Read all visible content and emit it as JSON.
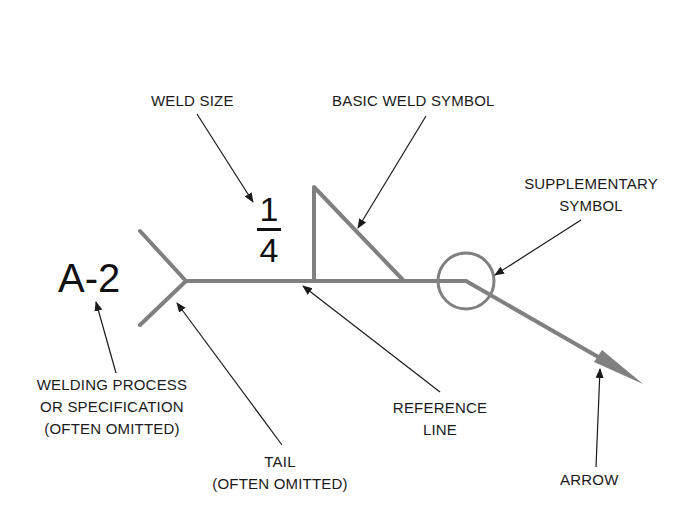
{
  "diagram": {
    "type": "welding-symbol-anatomy",
    "colors": {
      "symbol_line": "#808080",
      "leader": "#222222",
      "text": "#111111"
    },
    "weld_size": {
      "numerator": "1",
      "denominator": "4"
    },
    "process_spec": "A-2",
    "labels": {
      "weld_size": "WELD SIZE",
      "basic_weld_symbol": "BASIC WELD SYMBOL",
      "supplementary_symbol_line1": "SUPPLEMENTARY",
      "supplementary_symbol_line2": "SYMBOL",
      "welding_process_line1": "WELDING PROCESS",
      "welding_process_line2": "OR SPECIFICATION",
      "welding_process_line3": "(OFTEN OMITTED)",
      "tail_line1": "TAIL",
      "tail_line2": "(OFTEN OMITTED)",
      "reference_line_line1": "REFERENCE",
      "reference_line_line2": "LINE",
      "arrow": "ARROW"
    }
  }
}
